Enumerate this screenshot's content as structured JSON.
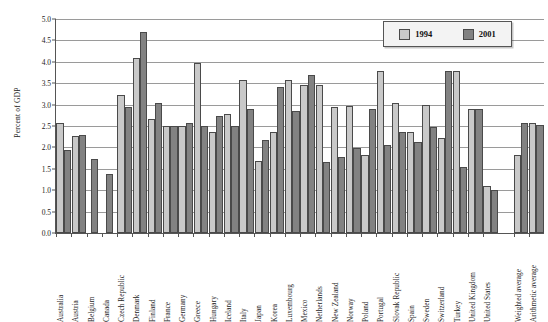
{
  "chart_data": {
    "type": "bar",
    "title": "",
    "xlabel": "",
    "ylabel": "Percent of GDP",
    "ylim": [
      0.0,
      5.0
    ],
    "ytick_step": 0.5,
    "ytick_labels": [
      "5.0",
      "4.5",
      "4.0",
      "3.5",
      "3.0",
      "2.5",
      "2.0",
      "1.5",
      "1.0",
      "0.5",
      "0.0"
    ],
    "grid": true,
    "legend_position": "top-right",
    "categories": [
      "Australia",
      "Austria",
      "Belgium",
      "Canada",
      "Czech Republic",
      "Denmark",
      "Finland",
      "France",
      "Germany",
      "Greece",
      "Hungary",
      "Iceland",
      "Italy",
      "Japan",
      "Korea",
      "Luxembourg",
      "Mexico",
      "Netherlands",
      "New Zealand",
      "Norway",
      "Poland",
      "Portugal",
      "Slovak Republic",
      "Spain",
      "Sweden",
      "Switzerland",
      "Turkey",
      "United Kingdom",
      "United States",
      "",
      "Weighted average",
      "Arithmetic average"
    ],
    "series": [
      {
        "name": "1994",
        "color": "#c9c9c9",
        "values": [
          2.57,
          2.27,
          null,
          null,
          3.23,
          4.08,
          2.67,
          2.5,
          2.51,
          3.97,
          2.35,
          2.77,
          3.58,
          1.69,
          2.35,
          3.57,
          3.45,
          3.46,
          2.95,
          2.96,
          1.83,
          3.78,
          3.03,
          2.35,
          2.99,
          2.21,
          3.79,
          2.89,
          1.1,
          null,
          1.83,
          2.58
        ]
      },
      {
        "name": "2001",
        "color": "#828282",
        "values": [
          1.93,
          2.3,
          1.74,
          1.37,
          2.94,
          4.7,
          3.03,
          2.5,
          2.58,
          2.51,
          2.74,
          2.51,
          2.89,
          2.18,
          3.42,
          2.86,
          3.69,
          1.67,
          1.78,
          1.98,
          2.89,
          2.05,
          2.36,
          2.12,
          2.47,
          3.78,
          1.55,
          2.89,
          1.0,
          null,
          2.58,
          2.52
        ]
      }
    ]
  },
  "legend": {
    "items": [
      {
        "label": "1994",
        "color": "#c9c9c9"
      },
      {
        "label": "2001",
        "color": "#828282"
      }
    ]
  }
}
